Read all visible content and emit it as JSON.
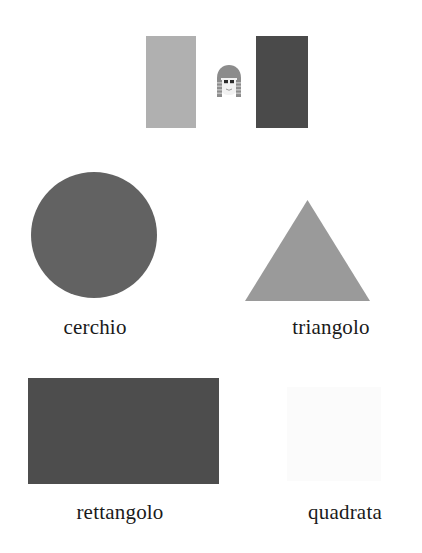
{
  "page": {
    "background_color": "#ffffff",
    "language": "Italian"
  },
  "top_row": {
    "name": "comparison-row",
    "left_rectangle": {
      "label": "light-gray-rectangle",
      "color": "#b0b0b0"
    },
    "right_rectangle": {
      "label": "dark-gray-rectangle",
      "color": "#4a4a4a"
    },
    "figure": {
      "label": "cartoon-face",
      "hair_color": "#8c8c8c",
      "face_color": "#f2f2f2",
      "eye_color": "#2b2b2b"
    }
  },
  "shapes": [
    {
      "id": "circle",
      "label": "cerchio",
      "type": "circle",
      "color": "#626262",
      "size": "126"
    },
    {
      "id": "triangle",
      "label": "triangolo",
      "type": "triangle",
      "color": "#9a9a9a",
      "size": "125"
    },
    {
      "id": "rectangle",
      "label": "rettangolo",
      "type": "rectangle",
      "color": "#4d4d4d",
      "size": "191x106"
    },
    {
      "id": "square",
      "label": "quadrata",
      "type": "square",
      "color": "#fbfbfb",
      "size": "94"
    }
  ]
}
